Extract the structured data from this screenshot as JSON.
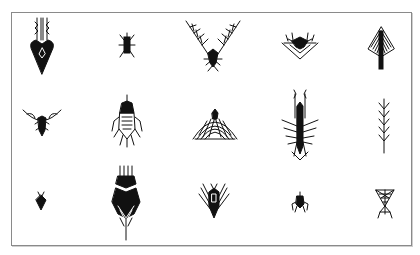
{
  "figure": {
    "rows": 3,
    "columns": 5,
    "stroke_color": "#111111",
    "border_color": "#8a8a8a",
    "background": "#ffffff",
    "items": [
      {
        "row": 1,
        "col": 1,
        "name": "biomorph-arrow"
      },
      {
        "row": 1,
        "col": 2,
        "name": "biomorph-small-bug"
      },
      {
        "row": 1,
        "col": 3,
        "name": "biomorph-v-wings"
      },
      {
        "row": 1,
        "col": 4,
        "name": "biomorph-crown"
      },
      {
        "row": 1,
        "col": 5,
        "name": "biomorph-kite"
      },
      {
        "row": 2,
        "col": 1,
        "name": "biomorph-bat"
      },
      {
        "row": 2,
        "col": 2,
        "name": "biomorph-fly"
      },
      {
        "row": 2,
        "col": 3,
        "name": "biomorph-dome"
      },
      {
        "row": 2,
        "col": 4,
        "name": "biomorph-mantis"
      },
      {
        "row": 2,
        "col": 5,
        "name": "biomorph-spine"
      },
      {
        "row": 3,
        "col": 1,
        "name": "biomorph-tiny-diamond"
      },
      {
        "row": 3,
        "col": 2,
        "name": "biomorph-rocket"
      },
      {
        "row": 3,
        "col": 3,
        "name": "biomorph-fan"
      },
      {
        "row": 3,
        "col": 4,
        "name": "biomorph-beetle"
      },
      {
        "row": 3,
        "col": 5,
        "name": "biomorph-web"
      }
    ]
  }
}
